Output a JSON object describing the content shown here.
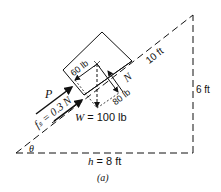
{
  "figure": {
    "caption": "(a)",
    "labels": {
      "hypotenuse": "10 ft",
      "height": "6 ft",
      "base": "h = 8 ft",
      "angle": "θ",
      "push_force": "P",
      "friction": "fₛ = 0.3 N",
      "normal": "N",
      "parallel_component": "60 lb",
      "perpendicular_component": "80 lb",
      "weight": "W = 100 lb"
    }
  }
}
